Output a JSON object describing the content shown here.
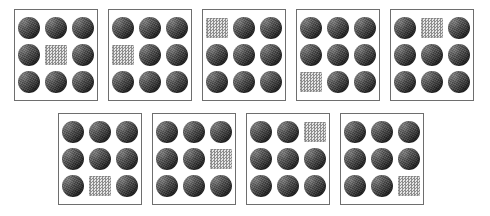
{
  "board": {
    "title": "odd-one-out visual search panels",
    "background_color": "#ffffff",
    "panel_border_color": "#6e6e6e",
    "circle_color": "#4a4a4a",
    "square_color": "#d9d9d9",
    "rows": 2,
    "panel_count": 9,
    "grid_rows": 3,
    "grid_cols": 3,
    "cells_per_panel": 9
  },
  "legend": {
    "circle_label": "dark textured circle",
    "square_label": "checkered square",
    "circle_icon": "filled-circle-icon",
    "square_icon": "checkered-square-icon"
  },
  "rows": [
    {
      "name": "top-row",
      "panels": [
        {
          "id": "panel-1",
          "label": "Panel 1",
          "odd_index": 4,
          "odd_position": "middle-center",
          "cells": [
            "circle",
            "circle",
            "circle",
            "circle",
            "square",
            "circle",
            "circle",
            "circle",
            "circle"
          ]
        },
        {
          "id": "panel-2",
          "label": "Panel 2",
          "odd_index": 3,
          "odd_position": "middle-left",
          "cells": [
            "circle",
            "circle",
            "circle",
            "square",
            "circle",
            "circle",
            "circle",
            "circle",
            "circle"
          ]
        },
        {
          "id": "panel-3",
          "label": "Panel 3",
          "odd_index": 0,
          "odd_position": "top-left",
          "cells": [
            "square",
            "circle",
            "circle",
            "circle",
            "circle",
            "circle",
            "circle",
            "circle",
            "circle"
          ]
        },
        {
          "id": "panel-4",
          "label": "Panel 4",
          "odd_index": 6,
          "odd_position": "bottom-left",
          "cells": [
            "circle",
            "circle",
            "circle",
            "circle",
            "circle",
            "circle",
            "square",
            "circle",
            "circle"
          ]
        },
        {
          "id": "panel-5",
          "label": "Panel 5",
          "odd_index": 1,
          "odd_position": "top-center",
          "cells": [
            "circle",
            "square",
            "circle",
            "circle",
            "circle",
            "circle",
            "circle",
            "circle",
            "circle"
          ]
        }
      ]
    },
    {
      "name": "bottom-row",
      "panels": [
        {
          "id": "panel-6",
          "label": "Panel 6",
          "odd_index": 7,
          "odd_position": "bottom-center",
          "cells": [
            "circle",
            "circle",
            "circle",
            "circle",
            "circle",
            "circle",
            "circle",
            "square",
            "circle"
          ]
        },
        {
          "id": "panel-7",
          "label": "Panel 7",
          "odd_index": 5,
          "odd_position": "middle-right",
          "cells": [
            "circle",
            "circle",
            "circle",
            "circle",
            "circle",
            "square",
            "circle",
            "circle",
            "circle"
          ]
        },
        {
          "id": "panel-8",
          "label": "Panel 8",
          "odd_index": 2,
          "odd_position": "top-right",
          "cells": [
            "circle",
            "circle",
            "square",
            "circle",
            "circle",
            "circle",
            "circle",
            "circle",
            "circle"
          ]
        },
        {
          "id": "panel-9",
          "label": "Panel 9",
          "odd_index": 8,
          "odd_position": "bottom-right",
          "cells": [
            "circle",
            "circle",
            "circle",
            "circle",
            "circle",
            "circle",
            "circle",
            "circle",
            "square"
          ]
        }
      ]
    }
  ]
}
